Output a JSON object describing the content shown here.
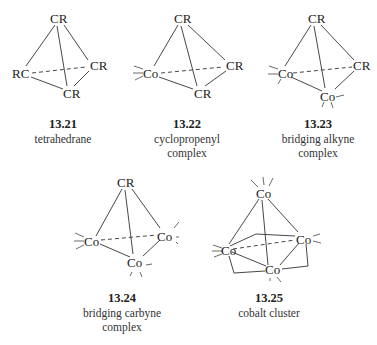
{
  "figure": {
    "structures": [
      {
        "id": "13.21",
        "number": "13.21",
        "caption_lines": [
          "tetrahedrane"
        ],
        "vertices": {
          "top": "CR",
          "left": "RC",
          "right": "CR",
          "bottom": "CR"
        }
      },
      {
        "id": "13.22",
        "number": "13.22",
        "caption_lines": [
          "cyclopropenyl",
          "complex"
        ],
        "vertices": {
          "top": "CR",
          "left": "Co",
          "right": "CR",
          "bottom": "CR"
        }
      },
      {
        "id": "13.23",
        "number": "13.23",
        "caption_lines": [
          "bridging alkyne",
          "complex"
        ],
        "vertices": {
          "top": "CR",
          "left": "Co",
          "right": "CR",
          "bottom": "Co"
        }
      },
      {
        "id": "13.24",
        "number": "13.24",
        "caption_lines": [
          "bridging carbyne",
          "complex"
        ],
        "vertices": {
          "top": "CR",
          "left": "Co",
          "right": "Co",
          "bottom": "Co"
        }
      },
      {
        "id": "13.25",
        "number": "13.25",
        "caption_lines": [
          "cobalt cluster"
        ],
        "vertices": {
          "top": "Co",
          "left": "Co",
          "right": "Co",
          "bottom": "Co"
        }
      }
    ]
  }
}
